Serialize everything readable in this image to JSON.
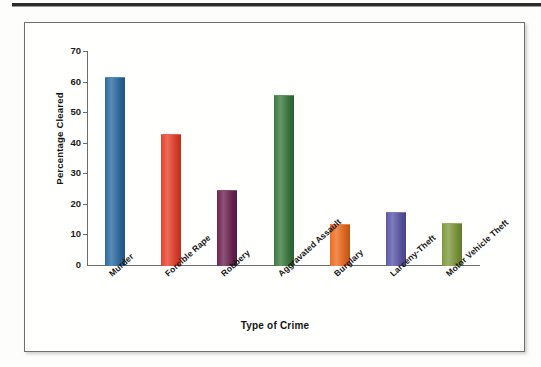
{
  "figure": {
    "frame_border_color": "#6f6f70",
    "background": "#fffffd"
  },
  "chart_data": {
    "type": "bar",
    "title": "",
    "xlabel": "Type of Crime",
    "ylabel": "Percentage Cleared",
    "categories": [
      "Murder",
      "Forcible Rape",
      "Robbery",
      "Aggravated Assault",
      "Burglary",
      "Larceny-Theft",
      "Motor Vehicle Theft"
    ],
    "values": [
      61.5,
      43.0,
      24.5,
      55.5,
      13.5,
      17.5,
      13.8
    ],
    "colors": [
      "#2a6ba3",
      "#e8402a",
      "#6e2252",
      "#3a7a3e",
      "#ee6b1f",
      "#5b57a8",
      "#7f9a3c"
    ],
    "ylim": [
      0,
      70
    ],
    "yticks": [
      0,
      10,
      20,
      30,
      40,
      50,
      60,
      70
    ],
    "ytick_labels": [
      "0",
      "10",
      "20",
      "30",
      "40",
      "50",
      "60",
      "70"
    ],
    "grid": false,
    "legend": "none",
    "axis_color": "#6d6d6d"
  }
}
